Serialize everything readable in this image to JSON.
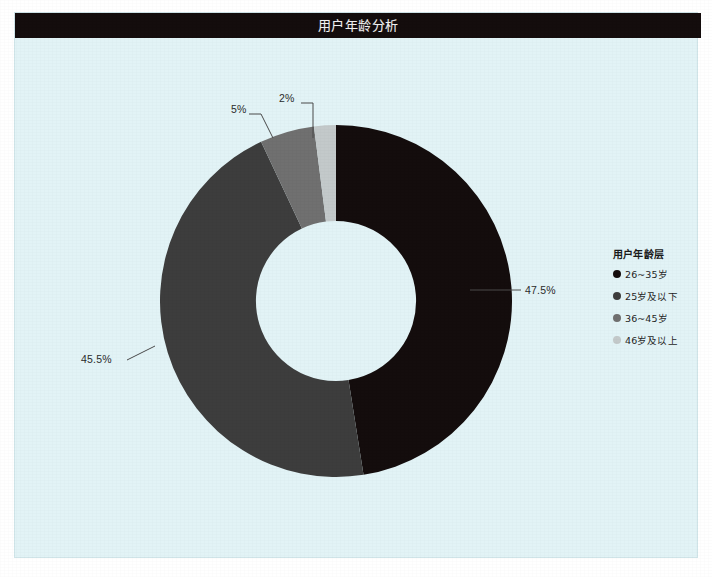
{
  "header": {
    "title": "用户年龄分析"
  },
  "legend": {
    "title": "用户年龄层",
    "position": "right",
    "items": [
      {
        "label": "26~35岁",
        "color": "#140d0d"
      },
      {
        "label": "25岁及以下",
        "color": "#3d3d3d"
      },
      {
        "label": "36~45岁",
        "color": "#707070"
      },
      {
        "label": "46岁及以上",
        "color": "#c3c9ca"
      }
    ]
  },
  "labels": {
    "p475": "47.5%",
    "p455": "45.5%",
    "p5": "5%",
    "p2": "2%"
  },
  "chart_data": {
    "type": "pie",
    "variant": "donut",
    "title": "用户年龄分析",
    "legend_title": "用户年龄层",
    "legend_position": "right",
    "start_angle_deg": 0,
    "direction": "clockwise",
    "inner_radius_ratio": 0.455,
    "categories": [
      "26~35岁",
      "25岁及以下",
      "36~45岁",
      "46岁及以上"
    ],
    "values": [
      47.5,
      45.5,
      5,
      2
    ],
    "value_labels": [
      "47.5%",
      "45.5%",
      "5%",
      "2%"
    ],
    "colors": [
      "#140d0d",
      "#3d3d3d",
      "#707070",
      "#c3c9ca"
    ],
    "units": "percent",
    "total": 100,
    "xlabel": "",
    "ylabel": "",
    "grid": false,
    "background_color": "#e2f3f6",
    "title_bar_color": "#140d0d",
    "title_text_color": "#f2f2f2"
  }
}
